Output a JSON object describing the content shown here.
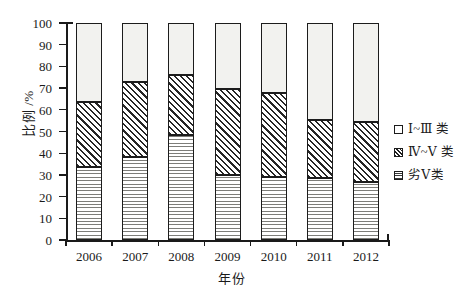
{
  "chart_data": {
    "type": "bar",
    "subtype": "stacked-bar-100",
    "title": "",
    "xlabel": "年份",
    "ylabel": "比例 /%",
    "ylim": [
      0,
      100
    ],
    "yticks": [
      0,
      10,
      20,
      30,
      40,
      50,
      60,
      70,
      80,
      90,
      100
    ],
    "ytick_labels": [
      "0",
      "10",
      "20",
      "30",
      "40",
      "50",
      "60",
      "70",
      "80",
      "90",
      "100"
    ],
    "grid": false,
    "legend_position": "right",
    "categories": [
      "2006",
      "2007",
      "2008",
      "2009",
      "2010",
      "2011",
      "2012"
    ],
    "series": [
      {
        "name": "劣Ⅴ类",
        "pattern": "horizontal-lines",
        "values": [
          33.5,
          38.2,
          48.4,
          30.0,
          29.0,
          28.6,
          26.7
        ]
      },
      {
        "name": "Ⅳ~Ⅴ类",
        "pattern": "diagonal-hatch",
        "values": [
          30.1,
          34.6,
          27.6,
          39.6,
          38.7,
          26.7,
          27.7
        ]
      },
      {
        "name": "Ⅰ~Ⅲ类",
        "pattern": "dots",
        "values": [
          36.4,
          27.2,
          24.0,
          30.4,
          32.3,
          44.7,
          45.6
        ]
      }
    ],
    "cumulative_boundaries": {
      "lower_top": [
        33.5,
        38.2,
        48.4,
        30.0,
        29.0,
        28.6,
        26.7
      ],
      "middle_top": [
        63.6,
        72.8,
        76.0,
        69.6,
        67.7,
        55.3,
        54.4
      ],
      "upper_top": [
        100,
        100,
        100,
        100,
        100,
        100,
        100
      ]
    }
  },
  "legend": {
    "items": [
      {
        "label": "Ⅰ~Ⅲ 类",
        "pattern": "dots"
      },
      {
        "label": "Ⅳ~Ⅴ 类",
        "pattern": "diagonal-hatch"
      },
      {
        "label": "劣Ⅴ类",
        "pattern": "horizontal-lines"
      }
    ]
  },
  "axes": {
    "y_title": "比例 /%",
    "x_title": "年份"
  },
  "colors": {
    "axis": "#1a1a1a",
    "text": "#1a1a1a",
    "background": "#ffffff",
    "dots_fill": "#f2f2ef",
    "hatch_fill": "#d8d8d4",
    "lines_fill": "#ebebe8"
  }
}
